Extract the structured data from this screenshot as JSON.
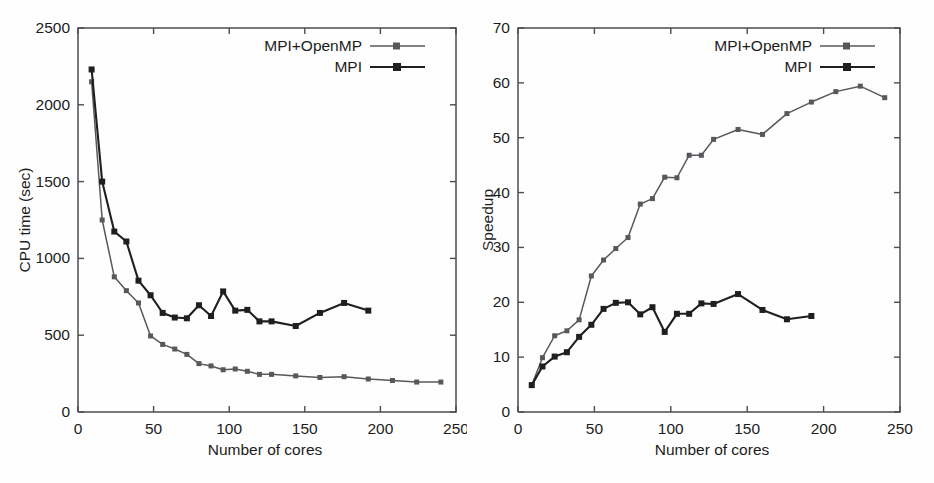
{
  "figure": {
    "panel_count": 2,
    "background_color": "#fefefe"
  },
  "series_colors": {
    "mpi_openmp": "#58585c",
    "mpi": "#1f1f22"
  },
  "legend": {
    "mpi_openmp_label": "MPI+OpenMP",
    "mpi_label": "MPI"
  },
  "chart_data": [
    {
      "id": "cpu-time",
      "type": "line",
      "title": "",
      "xlabel": "Number of cores",
      "ylabel": "CPU time (sec)",
      "xlim": [
        0,
        250
      ],
      "ylim": [
        0,
        2500
      ],
      "xticks": [
        0,
        50,
        100,
        150,
        200,
        250
      ],
      "yticks": [
        0,
        500,
        1000,
        1500,
        2000,
        2500
      ],
      "xticklabels": [
        "0",
        "50",
        "100",
        "150",
        "200",
        "250"
      ],
      "yticklabels": [
        "0",
        "500",
        "1000",
        "1500",
        "2000",
        "2500"
      ],
      "grid": false,
      "legend_position": "top-right",
      "series": [
        {
          "name": "MPI+OpenMP",
          "color": "#58585c",
          "marker": "square",
          "x": [
            9,
            16,
            24,
            32,
            40,
            48,
            56,
            64,
            72,
            80,
            88,
            96,
            104,
            112,
            120,
            128,
            144,
            160,
            176,
            192,
            208,
            224,
            240
          ],
          "y": [
            2150,
            1250,
            880,
            790,
            710,
            495,
            440,
            410,
            375,
            315,
            300,
            275,
            280,
            265,
            245,
            245,
            235,
            225,
            230,
            215,
            205,
            195,
            195
          ]
        },
        {
          "name": "MPI",
          "color": "#1f1f22",
          "marker": "square",
          "x": [
            9,
            16,
            24,
            32,
            40,
            48,
            56,
            64,
            72,
            80,
            88,
            96,
            104,
            112,
            120,
            128,
            144,
            160,
            176,
            192
          ],
          "y": [
            2230,
            1500,
            1175,
            1110,
            855,
            760,
            645,
            615,
            610,
            695,
            625,
            785,
            660,
            665,
            590,
            590,
            560,
            645,
            710,
            660
          ]
        }
      ]
    },
    {
      "id": "speedup",
      "type": "line",
      "title": "",
      "xlabel": "Number of cores",
      "ylabel": "Speedup",
      "xlim": [
        0,
        250
      ],
      "ylim": [
        0,
        70
      ],
      "xticks": [
        0,
        50,
        100,
        150,
        200,
        250
      ],
      "yticks": [
        0,
        10,
        20,
        30,
        40,
        50,
        60,
        70
      ],
      "xticklabels": [
        "0",
        "50",
        "100",
        "150",
        "200",
        "250"
      ],
      "yticklabels": [
        "0",
        "10",
        "20",
        "30",
        "40",
        "50",
        "60",
        "70"
      ],
      "grid": false,
      "legend_position": "top-right",
      "series": [
        {
          "name": "MPI+OpenMP",
          "color": "#58585c",
          "marker": "square",
          "x": [
            9,
            16,
            24,
            32,
            40,
            48,
            56,
            64,
            72,
            80,
            88,
            96,
            104,
            112,
            120,
            128,
            144,
            160,
            176,
            192,
            208,
            224,
            240
          ],
          "y": [
            4.9,
            9.9,
            13.9,
            14.8,
            16.8,
            24.8,
            27.7,
            29.8,
            31.8,
            37.9,
            38.9,
            42.8,
            42.7,
            46.8,
            46.8,
            49.7,
            51.5,
            50.6,
            54.4,
            56.5,
            58.4,
            59.4,
            57.3
          ]
        },
        {
          "name": "MPI",
          "color": "#1f1f22",
          "marker": "square",
          "x": [
            9,
            16,
            24,
            32,
            40,
            48,
            56,
            64,
            72,
            80,
            88,
            96,
            104,
            112,
            120,
            128,
            144,
            160,
            176,
            192
          ],
          "y": [
            4.9,
            8.3,
            10.1,
            10.9,
            13.7,
            15.9,
            18.8,
            19.9,
            20.0,
            17.8,
            19.1,
            14.6,
            17.9,
            17.9,
            19.8,
            19.7,
            21.5,
            18.6,
            16.9,
            17.5
          ]
        }
      ]
    }
  ]
}
